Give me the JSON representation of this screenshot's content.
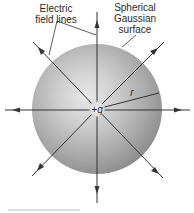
{
  "diagram": {
    "labels": {
      "field_lines_1": "Electric",
      "field_lines_2": "field lines",
      "surface_1": "Spherical",
      "surface_2": "Gaussian",
      "surface_3": "surface",
      "charge": "+q",
      "radius": "r"
    },
    "colors": {
      "line": "#333333",
      "sphere_light": "#e6e6e6",
      "sphere_dark": "#8f8f8f",
      "text": "#2a2a2a"
    }
  }
}
